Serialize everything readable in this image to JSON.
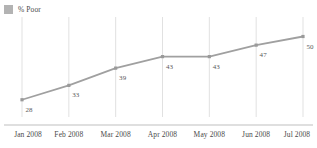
{
  "legend": {
    "position": "top-left",
    "entries": [
      {
        "label": "% Poor",
        "color": "#b3b3b3",
        "swatch_name": "legend-swatch-percent-poor"
      }
    ]
  },
  "chart_data": {
    "type": "line",
    "title": "",
    "subtitle": "",
    "xlabel": "",
    "ylabel": "",
    "categories": [
      "Jan 2008",
      "Feb 2008",
      "Mar 2008",
      "Apr 2008",
      "May 2008",
      "Jun 2008",
      "Jul 2008"
    ],
    "series": [
      {
        "name": "% Poor",
        "color": "#a0a0a0",
        "values": [
          28,
          33,
          39,
          43,
          43,
          47,
          50
        ],
        "point_labels": [
          "28",
          "33",
          "39",
          "43",
          "43",
          "47",
          "50"
        ],
        "marker": "square"
      }
    ],
    "ylim": [
      22,
      54
    ],
    "grid": {
      "vertical": true,
      "horizontal": false,
      "color": "#d9d9d9"
    },
    "axis": {
      "baseline": true,
      "baseline_color": "#bfbfbf"
    },
    "legend_position": "top-left"
  },
  "colors": {
    "line": "#a0a0a0",
    "marker": "#9a9a9a",
    "gridline": "#d9d9d9",
    "axis": "#bfbfbf",
    "text": "#4a4a4a",
    "label_text": "#5a5a5a",
    "swatch": "#b3b3b3",
    "background": "#ffffff"
  }
}
